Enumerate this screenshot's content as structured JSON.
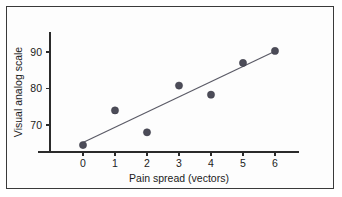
{
  "chart_data": {
    "type": "scatter",
    "title": "",
    "xlabel": "Pain spread (vectors)",
    "ylabel": "Visual analog scale",
    "x": [
      0,
      1,
      2,
      3,
      4,
      5,
      6
    ],
    "values": [
      64.5,
      74.0,
      68.0,
      80.8,
      78.3,
      87.0,
      90.3
    ],
    "series": [
      {
        "name": "Observations",
        "points": [
          {
            "x": 0,
            "y": 64.5
          },
          {
            "x": 1,
            "y": 74.0
          },
          {
            "x": 2,
            "y": 68.0
          },
          {
            "x": 3,
            "y": 80.8
          },
          {
            "x": 4,
            "y": 78.3
          },
          {
            "x": 5,
            "y": 87.0
          },
          {
            "x": 6,
            "y": 90.3
          }
        ]
      },
      {
        "name": "Regression line",
        "type": "line",
        "points": [
          {
            "x": 0,
            "y": 65.2
          },
          {
            "x": 6,
            "y": 90.2
          }
        ]
      }
    ],
    "xticks": [
      "0",
      "1",
      "2",
      "3",
      "4",
      "5",
      "6"
    ],
    "xtick_values": [
      0,
      1,
      2,
      3,
      4,
      5,
      6
    ],
    "yticks": [
      "70",
      "80",
      "90"
    ],
    "ytick_values": [
      70,
      80,
      90
    ],
    "xlim": [
      -0.55,
      6.55
    ],
    "ylim": [
      62.0,
      95.0
    ],
    "grid": false,
    "legend": "none",
    "colors": {
      "point": "#4c4c58",
      "line": "#5a5a66",
      "axis": "#2b2b2b",
      "frame": "#3a3a3a",
      "background": "#fdfdfd"
    }
  }
}
